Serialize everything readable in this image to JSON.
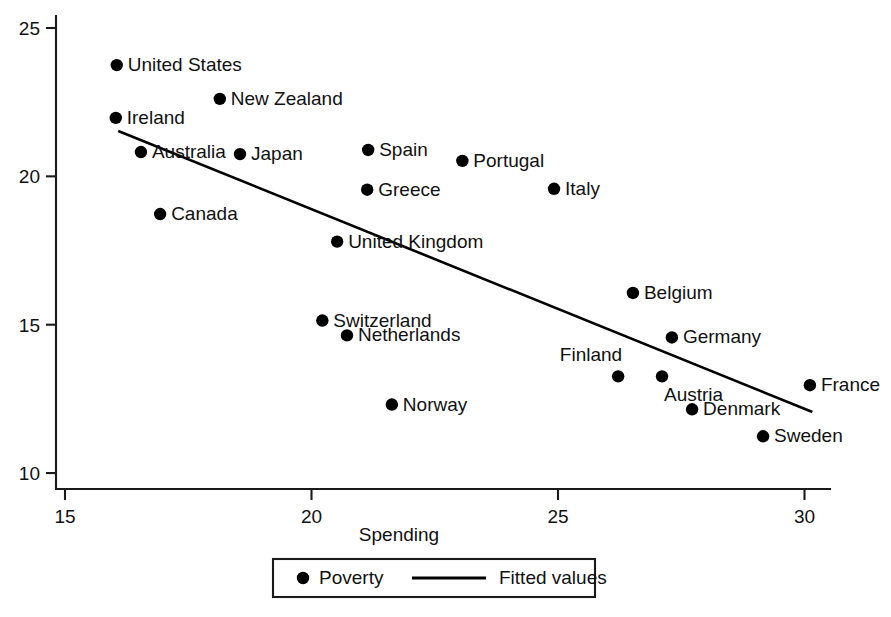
{
  "chart_data": {
    "type": "scatter",
    "title": "",
    "xlabel": "Spending",
    "ylabel": "",
    "xlim": [
      14.6,
      30.8
    ],
    "ylim": [
      9.4,
      25.4
    ],
    "xticks": [
      15,
      20,
      25,
      30
    ],
    "yticks": [
      10,
      15,
      20,
      25
    ],
    "xtick_labels": [
      "15",
      "20",
      "25",
      "30"
    ],
    "ytick_labels": [
      "10",
      "15",
      "20",
      "25"
    ],
    "grid": false,
    "legend": {
      "position": "below-axis-centered",
      "entries": [
        {
          "label": "Poverty",
          "marker": "filled-circle"
        },
        {
          "label": "Fitted values",
          "marker": "line"
        }
      ]
    },
    "series": [
      {
        "name": "Poverty",
        "marker": "filled-circle",
        "points": [
          {
            "label": "United States",
            "x": 16.05,
            "y": 23.75,
            "label_side": "right"
          },
          {
            "label": "New Zealand",
            "x": 18.14,
            "y": 22.61,
            "label_side": "right"
          },
          {
            "label": "Ireland",
            "x": 16.03,
            "y": 21.97,
            "label_side": "right"
          },
          {
            "label": "Australia",
            "x": 16.54,
            "y": 20.82,
            "label_side": "right"
          },
          {
            "label": "Japan",
            "x": 18.55,
            "y": 20.75,
            "label_side": "right"
          },
          {
            "label": "Spain",
            "x": 21.15,
            "y": 20.89,
            "label_side": "right"
          },
          {
            "label": "Portugal",
            "x": 23.06,
            "y": 20.52,
            "label_side": "right"
          },
          {
            "label": "Greece",
            "x": 21.13,
            "y": 19.55,
            "label_side": "right"
          },
          {
            "label": "Italy",
            "x": 24.92,
            "y": 19.58,
            "label_side": "right"
          },
          {
            "label": "Canada",
            "x": 16.93,
            "y": 18.73,
            "label_side": "right"
          },
          {
            "label": "United Kingdom",
            "x": 20.52,
            "y": 17.8,
            "label_side": "right"
          },
          {
            "label": "Belgium",
            "x": 26.52,
            "y": 16.07,
            "label_side": "right"
          },
          {
            "label": "Switzerland",
            "x": 20.22,
            "y": 15.14,
            "label_side": "right"
          },
          {
            "label": "Netherlands",
            "x": 20.72,
            "y": 14.64,
            "label_side": "right"
          },
          {
            "label": "Germany",
            "x": 27.31,
            "y": 14.57,
            "label_side": "right"
          },
          {
            "label": "Finland",
            "x": 26.22,
            "y": 13.26,
            "label_side": "above-left"
          },
          {
            "label": "Austria",
            "x": 27.11,
            "y": 13.26,
            "label_side": "below-right"
          },
          {
            "label": "France",
            "x": 30.11,
            "y": 12.96,
            "label_side": "right"
          },
          {
            "label": "Norway",
            "x": 21.63,
            "y": 12.31,
            "label_side": "right"
          },
          {
            "label": "Denmark",
            "x": 27.72,
            "y": 12.15,
            "label_side": "right"
          },
          {
            "label": "Sweden",
            "x": 29.16,
            "y": 11.24,
            "label_side": "right"
          }
        ]
      },
      {
        "name": "Fitted values",
        "type": "line",
        "endpoints": [
          {
            "x": 16.08,
            "y": 21.53
          },
          {
            "x": 30.16,
            "y": 12.06
          }
        ]
      }
    ]
  },
  "colors": {
    "marker": "#000000",
    "line": "#000000",
    "axis": "#1a1a1a",
    "text": "#111111",
    "background": "#ffffff"
  }
}
